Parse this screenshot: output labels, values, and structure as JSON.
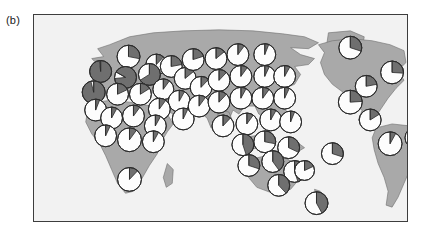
{
  "figure": {
    "panel_label": "(b)",
    "type": "map-with-pie-markers",
    "frame": {
      "x": 33,
      "y": 14,
      "width": 375,
      "height": 208,
      "border_color": "#3d3d3d"
    },
    "colors": {
      "ocean": "#f2f2f2",
      "land": "#a9a9a9",
      "land_outline": "#6e6e6e",
      "pie_light": "#fdfdfd",
      "pie_dark": "#6f6f6f",
      "pie_outline": "#2b2b2b",
      "panel_label_color": "#1a1a1a"
    },
    "projection": {
      "name": "equirectangular",
      "lon_range": [
        -180,
        180
      ],
      "lat_range": [
        -60,
        84
      ]
    }
  },
  "chart_data": {
    "type": "pie",
    "title": "(b)",
    "subtitle": "",
    "xlabel": "",
    "ylabel": "",
    "grid": false,
    "legend_position": "none",
    "slice_categories": [
      "light",
      "dark"
    ],
    "slice_colors": [
      "#fdfdfd",
      "#6f6f6f"
    ],
    "marker_count": 57,
    "markers": [
      {
        "region": "N Europe / Scandinavia",
        "cx": 95,
        "cy": 42,
        "r": 11.5,
        "light": 0.72,
        "dark": 0.28,
        "start": 0
      },
      {
        "region": "Baltic",
        "cx": 123,
        "cy": 50,
        "r": 10.5,
        "light": 0.88,
        "dark": 0.12,
        "start": 0
      },
      {
        "region": "British Isles",
        "cx": 67,
        "cy": 57,
        "r": 11.0,
        "light": 0.02,
        "dark": 0.98,
        "start": 0
      },
      {
        "region": "W Europe",
        "cx": 92,
        "cy": 63,
        "r": 11.0,
        "light": 0.1,
        "dark": 0.9,
        "start": 300
      },
      {
        "region": "C Europe",
        "cx": 116,
        "cy": 60,
        "r": 11.0,
        "light": 0.34,
        "dark": 0.66,
        "start": 0
      },
      {
        "region": "E Europe",
        "cx": 138,
        "cy": 52,
        "r": 11.0,
        "light": 0.78,
        "dark": 0.22,
        "start": 0
      },
      {
        "region": "Iberia",
        "cx": 60,
        "cy": 78,
        "r": 11.5,
        "light": 0.04,
        "dark": 0.96,
        "start": 0
      },
      {
        "region": "W Mediterranean",
        "cx": 84,
        "cy": 80,
        "r": 11.0,
        "light": 0.82,
        "dark": 0.18,
        "start": 0
      },
      {
        "region": "Italy",
        "cx": 107,
        "cy": 80,
        "r": 11.0,
        "light": 0.84,
        "dark": 0.16,
        "start": 0
      },
      {
        "region": "Balkans",
        "cx": 130,
        "cy": 75,
        "r": 10.5,
        "light": 0.9,
        "dark": 0.1,
        "start": 0
      },
      {
        "region": "Black Sea",
        "cx": 152,
        "cy": 64,
        "r": 11.0,
        "light": 0.86,
        "dark": 0.14,
        "start": 0
      },
      {
        "region": "Caucasus",
        "cx": 168,
        "cy": 73,
        "r": 11.0,
        "light": 0.88,
        "dark": 0.12,
        "start": 0
      },
      {
        "region": "Anatolia",
        "cx": 146,
        "cy": 87,
        "r": 11.0,
        "light": 0.92,
        "dark": 0.08,
        "start": 0
      },
      {
        "region": "Levant",
        "cx": 126,
        "cy": 95,
        "r": 11.0,
        "light": 0.9,
        "dark": 0.1,
        "start": 0
      },
      {
        "region": "Arabia",
        "cx": 150,
        "cy": 105,
        "r": 11.0,
        "light": 0.93,
        "dark": 0.07,
        "start": 0
      },
      {
        "region": "W Russia",
        "cx": 160,
        "cy": 45,
        "r": 11.0,
        "light": 0.8,
        "dark": 0.2,
        "start": 0
      },
      {
        "region": "Urals",
        "cx": 183,
        "cy": 44,
        "r": 11.0,
        "light": 0.86,
        "dark": 0.14,
        "start": 0
      },
      {
        "region": "W Siberia",
        "cx": 205,
        "cy": 40,
        "r": 11.0,
        "light": 0.9,
        "dark": 0.1,
        "start": 0
      },
      {
        "region": "C Siberia",
        "cx": 232,
        "cy": 40,
        "r": 11.0,
        "light": 0.94,
        "dark": 0.06,
        "start": 0
      },
      {
        "region": "C Asia",
        "cx": 186,
        "cy": 66,
        "r": 11.0,
        "light": 0.88,
        "dark": 0.12,
        "start": 0
      },
      {
        "region": "Kazakh steppe",
        "cx": 208,
        "cy": 62,
        "r": 11.0,
        "light": 0.9,
        "dark": 0.1,
        "start": 0
      },
      {
        "region": "Mongolia",
        "cx": 232,
        "cy": 62,
        "r": 11.0,
        "light": 0.93,
        "dark": 0.07,
        "start": 0
      },
      {
        "region": "NE China",
        "cx": 252,
        "cy": 62,
        "r": 11.0,
        "light": 0.92,
        "dark": 0.08,
        "start": 0
      },
      {
        "region": "Iran",
        "cx": 166,
        "cy": 92,
        "r": 11.0,
        "light": 0.9,
        "dark": 0.1,
        "start": 0
      },
      {
        "region": "NW India",
        "cx": 186,
        "cy": 88,
        "r": 11.0,
        "light": 0.88,
        "dark": 0.12,
        "start": 0
      },
      {
        "region": "Himalaya",
        "cx": 208,
        "cy": 84,
        "r": 11.0,
        "light": 0.92,
        "dark": 0.08,
        "start": 0
      },
      {
        "region": "C China",
        "cx": 230,
        "cy": 84,
        "r": 11.0,
        "light": 0.9,
        "dark": 0.1,
        "start": 0
      },
      {
        "region": "E China",
        "cx": 252,
        "cy": 84,
        "r": 11.0,
        "light": 0.93,
        "dark": 0.07,
        "start": 0
      },
      {
        "region": "S India",
        "cx": 190,
        "cy": 112,
        "r": 11.0,
        "light": 0.88,
        "dark": 0.12,
        "start": 0
      },
      {
        "region": "SE Asia",
        "cx": 214,
        "cy": 110,
        "r": 11.0,
        "light": 0.9,
        "dark": 0.1,
        "start": 0
      },
      {
        "region": "S China",
        "cx": 238,
        "cy": 106,
        "r": 11.0,
        "light": 0.92,
        "dark": 0.08,
        "start": 0
      },
      {
        "region": "Philippines",
        "cx": 258,
        "cy": 108,
        "r": 11.0,
        "light": 0.94,
        "dark": 0.06,
        "start": 0
      },
      {
        "region": "Sumatra",
        "cx": 210,
        "cy": 131,
        "r": 11.0,
        "light": 0.55,
        "dark": 0.45,
        "start": 0
      },
      {
        "region": "Borneo",
        "cx": 232,
        "cy": 128,
        "r": 11.0,
        "light": 0.72,
        "dark": 0.28,
        "start": 0
      },
      {
        "region": "New Guinea",
        "cx": 256,
        "cy": 134,
        "r": 11.0,
        "light": 0.68,
        "dark": 0.32,
        "start": 0
      },
      {
        "region": "NW Australia",
        "cx": 216,
        "cy": 152,
        "r": 11.0,
        "light": 0.7,
        "dark": 0.3,
        "start": 0
      },
      {
        "region": "N Australia",
        "cx": 240,
        "cy": 148,
        "r": 11.0,
        "light": 0.6,
        "dark": 0.4,
        "start": 0
      },
      {
        "region": "E Australia",
        "cx": 262,
        "cy": 158,
        "r": 11.0,
        "light": 0.55,
        "dark": 0.45,
        "start": 0
      },
      {
        "region": "SE Australia",
        "cx": 246,
        "cy": 172,
        "r": 11.0,
        "light": 0.62,
        "dark": 0.38,
        "start": 0
      },
      {
        "region": "New Zealand",
        "cx": 284,
        "cy": 190,
        "r": 11.5,
        "light": 0.58,
        "dark": 0.42,
        "start": 0
      },
      {
        "region": "W Pacific",
        "cx": 300,
        "cy": 140,
        "r": 11.0,
        "light": 0.7,
        "dark": 0.3,
        "start": 0
      },
      {
        "region": "NW Africa",
        "cx": 62,
        "cy": 96,
        "r": 11.0,
        "light": 0.94,
        "dark": 0.06,
        "start": 0
      },
      {
        "region": "W Sahara",
        "cx": 78,
        "cy": 104,
        "r": 11.0,
        "light": 0.92,
        "dark": 0.08,
        "start": 0
      },
      {
        "region": "Sahel",
        "cx": 100,
        "cy": 102,
        "r": 11.0,
        "light": 0.9,
        "dark": 0.1,
        "start": 0
      },
      {
        "region": "NE Africa",
        "cx": 122,
        "cy": 112,
        "r": 11.0,
        "light": 0.92,
        "dark": 0.08,
        "start": 0
      },
      {
        "region": "W Africa",
        "cx": 72,
        "cy": 122,
        "r": 11.0,
        "light": 0.93,
        "dark": 0.07,
        "start": 0
      },
      {
        "region": "C Africa",
        "cx": 96,
        "cy": 126,
        "r": 12.0,
        "light": 0.9,
        "dark": 0.1,
        "start": 0
      },
      {
        "region": "E Africa",
        "cx": 120,
        "cy": 128,
        "r": 11.0,
        "light": 0.92,
        "dark": 0.08,
        "start": 0
      },
      {
        "region": "S Africa",
        "cx": 96,
        "cy": 166,
        "r": 12.0,
        "light": 0.88,
        "dark": 0.12,
        "start": 0
      },
      {
        "region": "Greenland",
        "cx": 318,
        "cy": 33,
        "r": 11.5,
        "light": 0.7,
        "dark": 0.3,
        "start": 0
      },
      {
        "region": "NE North America",
        "cx": 360,
        "cy": 58,
        "r": 11.5,
        "light": 0.74,
        "dark": 0.26,
        "start": 0
      },
      {
        "region": "C North America",
        "cx": 334,
        "cy": 72,
        "r": 11.0,
        "light": 0.78,
        "dark": 0.22,
        "start": 0
      },
      {
        "region": "SW North America",
        "cx": 318,
        "cy": 88,
        "r": 12.0,
        "light": 0.76,
        "dark": 0.24,
        "start": 0
      },
      {
        "region": "Mexico / C America",
        "cx": 338,
        "cy": 106,
        "r": 11.0,
        "light": 0.84,
        "dark": 0.16,
        "start": 0
      },
      {
        "region": "N South America",
        "cx": 358,
        "cy": 130,
        "r": 12.0,
        "light": 0.92,
        "dark": 0.08,
        "start": 0
      },
      {
        "region": "NE South America",
        "cx": 384,
        "cy": 124,
        "r": 11.0,
        "light": 0.94,
        "dark": 0.06,
        "start": 0
      },
      {
        "region": "Atlantic island",
        "cx": 272,
        "cy": 157,
        "r": 10.0,
        "light": 0.82,
        "dark": 0.18,
        "start": 0
      }
    ]
  }
}
